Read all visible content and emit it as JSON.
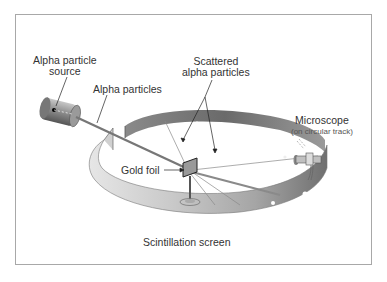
{
  "diagram": {
    "labels": {
      "source_line1": "Alpha particle",
      "source_line2": "source",
      "alpha_particles": "Alpha particles",
      "scattered_line1": "Scattered",
      "scattered_line2": "alpha particles",
      "microscope": "Microscope",
      "microscope_note": "(on circular track)",
      "gold_foil": "Gold foil",
      "screen": "Scintillation screen"
    },
    "colors": {
      "frame": "#a8a8a8",
      "screen_dark": "#6e6e6e",
      "screen_light": "#d8d8d8",
      "text": "#333333"
    }
  }
}
